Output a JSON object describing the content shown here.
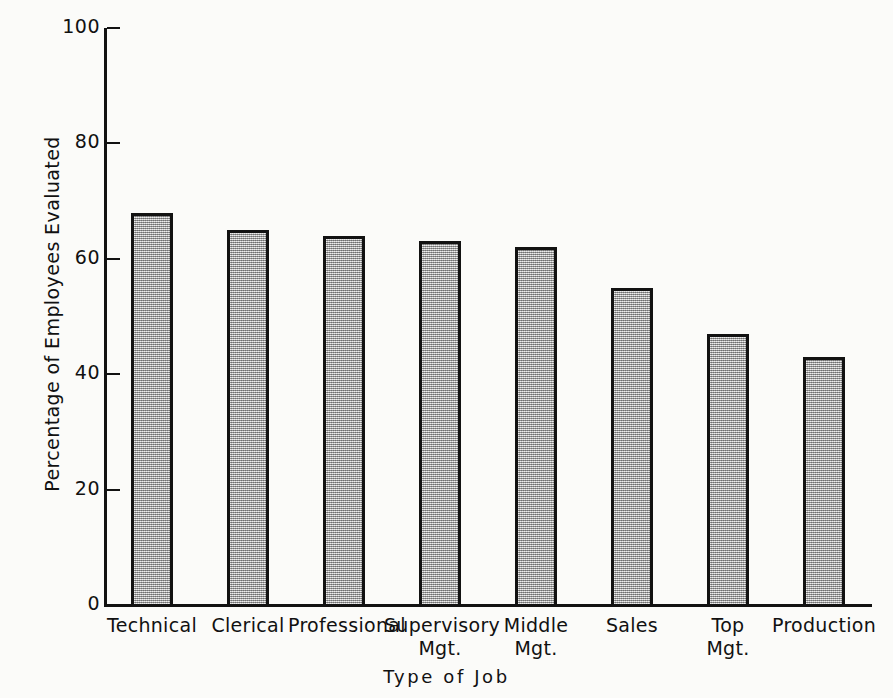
{
  "chart_data": {
    "type": "bar",
    "title": "",
    "xlabel": "Type of Job",
    "ylabel": "Percentage of Employees Evaluated",
    "categories": [
      "Technical",
      "Clerical",
      "Professional",
      "Supervisory\nMgt.",
      "Middle\nMgt.",
      "Sales",
      "Top\nMgt.",
      "Production"
    ],
    "values": [
      68,
      65,
      64,
      63,
      62,
      55,
      47,
      43
    ],
    "ylim": [
      0,
      100
    ],
    "yticks": [
      0,
      20,
      40,
      60,
      80,
      100
    ],
    "ytick_labels": [
      "0",
      "20",
      "40",
      "60",
      "80",
      "100"
    ],
    "grid": false,
    "legend": false,
    "bar_fill_color": "#b4b4b4",
    "bar_edge_color": "#121212",
    "background_color": "#fbfbf9"
  }
}
